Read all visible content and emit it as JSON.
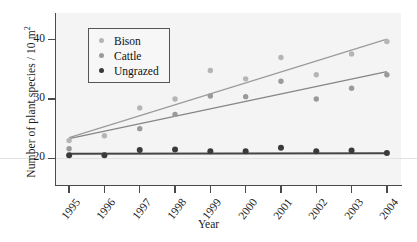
{
  "chart_data": {
    "type": "scatter",
    "title": "",
    "xlabel": "Year",
    "ylabel": "Number of plant species / 10 m",
    "ylabel_sup": "2",
    "categories": [
      "1995",
      "1996",
      "1997",
      "1998",
      "1999",
      "2000",
      "2001",
      "2002",
      "2003",
      "2004"
    ],
    "x": [
      1995,
      1996,
      1997,
      1998,
      1999,
      2000,
      2001,
      2002,
      2003,
      2004
    ],
    "xlim": [
      1994.6,
      2004.4
    ],
    "ylim": [
      15.5,
      44.5
    ],
    "yticks": [
      20,
      30,
      40
    ],
    "ytick_labels": [
      "20",
      "30",
      "40"
    ],
    "grid": false,
    "legend_position": "upper-left-inside",
    "series": [
      {
        "name": "Bison",
        "color": "#b5b5b5",
        "values": [
          23.0,
          23.8,
          28.5,
          30.0,
          34.8,
          33.4,
          37.0,
          34.1,
          37.6,
          39.7
        ],
        "trendline": {
          "start": 23.5,
          "end": 40.1,
          "color": "#9b9b9b"
        }
      },
      {
        "name": "Cattle",
        "color": "#9a9a9a",
        "values": [
          21.6,
          20.6,
          25.0,
          27.4,
          30.5,
          30.4,
          33.0,
          30.0,
          31.8,
          34.1
        ],
        "trendline": {
          "start": 23.3,
          "end": 34.6,
          "color": "#868686"
        }
      },
      {
        "name": "Ungrazed",
        "color": "#3a3a3a",
        "values": [
          20.5,
          20.5,
          21.4,
          21.5,
          21.2,
          21.2,
          21.8,
          21.2,
          21.3,
          20.9
        ],
        "trendline": {
          "start": 20.75,
          "end": 20.85,
          "color": "#444444"
        }
      }
    ]
  },
  "legend": {
    "items": [
      {
        "label": "Bison",
        "color": "#b5b5b5"
      },
      {
        "label": "Cattle",
        "color": "#9a9a9a"
      },
      {
        "label": "Ungrazed",
        "color": "#3a3a3a"
      }
    ]
  },
  "axes": {
    "x_title": "Year",
    "y_title": "Number of plant species / 10 m",
    "y_title_superscript": "2"
  }
}
